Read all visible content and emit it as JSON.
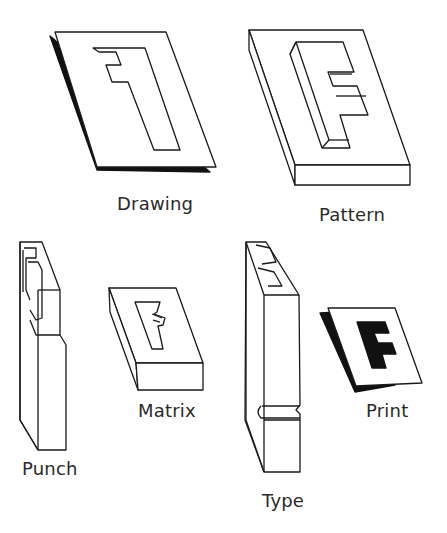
{
  "diagram": {
    "title": "",
    "stages": [
      {
        "id": "drawing",
        "label": "Drawing"
      },
      {
        "id": "pattern",
        "label": "Pattern"
      },
      {
        "id": "punch",
        "label": "Punch"
      },
      {
        "id": "matrix",
        "label": "Matrix"
      },
      {
        "id": "type",
        "label": "Type"
      },
      {
        "id": "print",
        "label": "Print"
      }
    ],
    "letter": "F",
    "colors": {
      "ink": "#111111",
      "paper": "#ffffff",
      "text": "#2a2a2a"
    }
  }
}
